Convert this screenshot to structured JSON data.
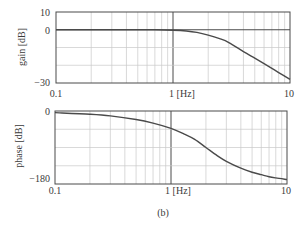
{
  "chart_data": [
    {
      "type": "line",
      "title": "",
      "xlabel": "[Hz]",
      "ylabel": "gain [dB]",
      "xscale": "log",
      "xlim": [
        0.1,
        10
      ],
      "ylim": [
        -30,
        10
      ],
      "x_ticks": [
        {
          "value": 0.1,
          "label": "0.1"
        },
        {
          "value": 1,
          "label": "1 [Hz]"
        },
        {
          "value": 10,
          "label": "10"
        }
      ],
      "y_ticks": [
        {
          "value": 10,
          "label": "10"
        },
        {
          "value": 0,
          "label": "0"
        },
        {
          "value": -30,
          "label": "−30"
        }
      ],
      "y_grid": [
        0,
        -10,
        -20
      ],
      "grid": true,
      "series": [
        {
          "name": "gain",
          "x": [
            0.1,
            0.2,
            0.3,
            0.5,
            0.7,
            1.0,
            1.3,
            1.6,
            2.0,
            2.5,
            3.0,
            4.0,
            5.0,
            6.0,
            7.0,
            8.0,
            10.0
          ],
          "values": [
            0,
            0,
            0,
            0,
            -0.01,
            -0.26,
            -0.7,
            -1.5,
            -3.0,
            -5.0,
            -7.2,
            -12.3,
            -16.0,
            -19.1,
            -21.8,
            -24.1,
            -28.0
          ]
        }
      ]
    },
    {
      "type": "line",
      "title": "",
      "xlabel": "[Hz]",
      "ylabel": "phase [dB]",
      "xscale": "log",
      "xlim": [
        0.1,
        10
      ],
      "ylim": [
        -180,
        0
      ],
      "x_ticks": [
        {
          "value": 0.1,
          "label": "0.1"
        },
        {
          "value": 1,
          "label": "1 [Hz]"
        },
        {
          "value": 10,
          "label": "10"
        }
      ],
      "y_ticks": [
        {
          "value": 0,
          "label": "0"
        },
        {
          "value": -180,
          "label": "−180"
        }
      ],
      "y_grid": [
        -45,
        -90,
        -135
      ],
      "grid": true,
      "series": [
        {
          "name": "phase",
          "x": [
            0.1,
            0.2,
            0.3,
            0.5,
            0.7,
            1.0,
            1.3,
            1.6,
            2.0,
            2.5,
            3.0,
            4.0,
            5.0,
            6.0,
            7.0,
            8.0,
            10.0
          ],
          "values": [
            -4,
            -8,
            -12,
            -21,
            -30,
            -43,
            -57,
            -70,
            -90,
            -110,
            -124,
            -141,
            -151,
            -157,
            -162,
            -165,
            -169
          ]
        }
      ]
    }
  ],
  "plots": {
    "gain": {
      "ylabel": "gain [dB]",
      "ytick_top": "10",
      "ytick_zero": "0",
      "ytick_bottom": "−30",
      "xtick_left": "0.1",
      "xtick_mid": "1 [Hz]",
      "xtick_right": "10"
    },
    "phase": {
      "ylabel": "phase [dB]",
      "ytick_top": "0",
      "ytick_bottom": "−180",
      "xtick_left": "0.1",
      "xtick_mid": "1 [Hz]",
      "xtick_right": "10"
    }
  },
  "caption": "(b)",
  "colors": {
    "curve": "#4a4a4a",
    "frame": "#4a4a4a",
    "grid": "#c8c8c8",
    "text": "#3a3a3a"
  }
}
